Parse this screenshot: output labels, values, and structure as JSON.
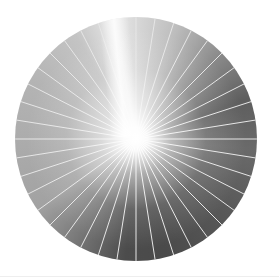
{
  "image": {
    "subject": "radial sunburst disc",
    "segments": 40,
    "segment_angle_deg": 9,
    "center": [
      136,
      139
    ],
    "radius": 121,
    "colors": {
      "ray_line": "#e6e6e6",
      "light_side": "#b4b4b4",
      "dark_side": "#4a4a4a",
      "glow": "#ffffff",
      "background": "#ffffff"
    }
  }
}
